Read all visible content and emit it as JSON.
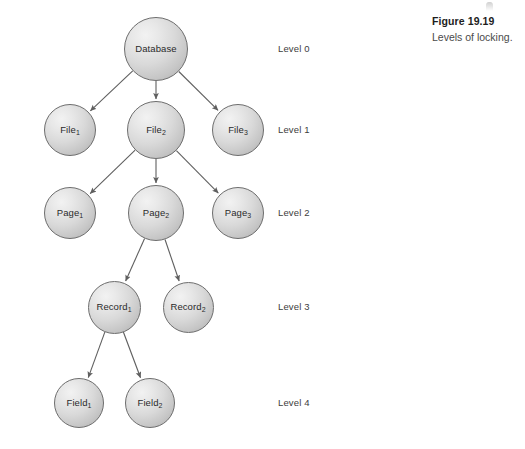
{
  "figure": {
    "number": "Figure 19.19",
    "title": "Levels of locking."
  },
  "diagram": {
    "type": "tree",
    "nodes": [
      {
        "id": "database",
        "label": "Database",
        "sub": "",
        "level": 0,
        "cx": 156,
        "cy": 49,
        "d": 64
      },
      {
        "id": "file1",
        "label": "File",
        "sub": "1",
        "level": 1,
        "cx": 70,
        "cy": 130,
        "d": 52
      },
      {
        "id": "file2",
        "label": "File",
        "sub": "2",
        "level": 1,
        "cx": 156,
        "cy": 130,
        "d": 58
      },
      {
        "id": "file3",
        "label": "File",
        "sub": "3",
        "level": 1,
        "cx": 238,
        "cy": 130,
        "d": 52
      },
      {
        "id": "page1",
        "label": "Page",
        "sub": "1",
        "level": 2,
        "cx": 70,
        "cy": 213,
        "d": 52
      },
      {
        "id": "page2",
        "label": "Page",
        "sub": "2",
        "level": 2,
        "cx": 156,
        "cy": 213,
        "d": 56
      },
      {
        "id": "page3",
        "label": "Page",
        "sub": "3",
        "level": 2,
        "cx": 238,
        "cy": 213,
        "d": 52
      },
      {
        "id": "record1",
        "label": "Record",
        "sub": "1",
        "level": 3,
        "cx": 114,
        "cy": 307,
        "d": 53
      },
      {
        "id": "record2",
        "label": "Record",
        "sub": "2",
        "level": 3,
        "cx": 188,
        "cy": 307,
        "d": 51
      },
      {
        "id": "field1",
        "label": "Field",
        "sub": "1",
        "level": 4,
        "cx": 79,
        "cy": 403,
        "d": 50
      },
      {
        "id": "field2",
        "label": "Field",
        "sub": "2",
        "level": 4,
        "cx": 150,
        "cy": 403,
        "d": 50
      }
    ],
    "edges": [
      {
        "from": "database",
        "to": "file1"
      },
      {
        "from": "database",
        "to": "file2"
      },
      {
        "from": "database",
        "to": "file3"
      },
      {
        "from": "file2",
        "to": "page1"
      },
      {
        "from": "file2",
        "to": "page2"
      },
      {
        "from": "file2",
        "to": "page3"
      },
      {
        "from": "page2",
        "to": "record1"
      },
      {
        "from": "page2",
        "to": "record2"
      },
      {
        "from": "record1",
        "to": "field1"
      },
      {
        "from": "record1",
        "to": "field2"
      }
    ],
    "levels": [
      {
        "label": "Level 0",
        "y": 49
      },
      {
        "label": "Level 1",
        "y": 130
      },
      {
        "label": "Level 2",
        "y": 213
      },
      {
        "label": "Level 3",
        "y": 307
      },
      {
        "label": "Level 4",
        "y": 403
      }
    ],
    "level_label_x": 278
  },
  "colors": {
    "node_stroke": "#6d6d6d",
    "edge_stroke": "#5f5f5f",
    "text": "#2a2a2a",
    "caption_number": "#1d1d1d",
    "caption_title": "#4a4a4a",
    "background": "#ffffff"
  }
}
